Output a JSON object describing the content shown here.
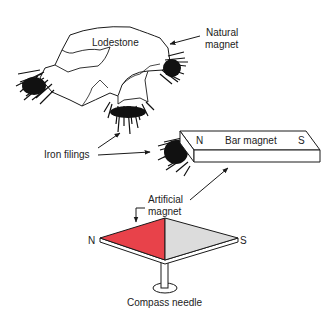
{
  "diagram": {
    "labels": {
      "lodestone": "Lodestone",
      "natural_magnet_line1": "Natural",
      "natural_magnet_line2": "magnet",
      "iron_filings": "Iron filings",
      "bar_magnet": "Bar magnet",
      "bar_north": "N",
      "bar_south": "S",
      "artificial_magnet_line1": "Artificial",
      "artificial_magnet_line2": "magnet",
      "compass_north": "N",
      "compass_south": "S",
      "compass_needle": "Compass needle"
    },
    "colors": {
      "compass_north_fill": "#e8424a",
      "compass_south_fill": "#dcdcdc",
      "line": "#1a1a1a",
      "filings": "#111111"
    }
  }
}
